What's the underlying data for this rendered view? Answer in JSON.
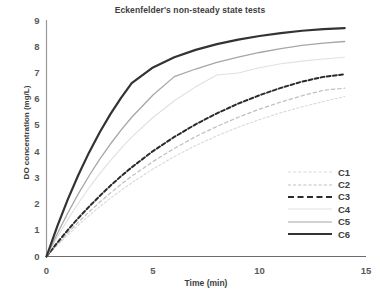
{
  "chart_data": {
    "type": "line",
    "title": "Eckenfelder's non-steady state tests",
    "xlabel": "Time (min)",
    "ylabel": "DO concentration (mg/L)",
    "xlim": [
      0,
      15
    ],
    "ylim": [
      0,
      9
    ],
    "xticks": [
      "0",
      "5",
      "10",
      "15"
    ],
    "yticks": [
      "0",
      "1",
      "2",
      "3",
      "4",
      "5",
      "6",
      "7",
      "8",
      "9"
    ],
    "grid": false,
    "legend_position": "inside-lower-right",
    "x": [
      0,
      0.5,
      1,
      1.5,
      2,
      2.5,
      3,
      3.5,
      4,
      5,
      6,
      7,
      8,
      9,
      10,
      11,
      12,
      13,
      14
    ],
    "series": [
      {
        "name": "C1",
        "style": "dotted",
        "color": "#d9d9d9",
        "width": 1.1,
        "values": [
          0,
          0.42,
          0.82,
          1.2,
          1.56,
          1.9,
          2.22,
          2.52,
          2.81,
          3.34,
          3.81,
          4.23,
          4.6,
          4.93,
          5.22,
          5.48,
          5.71,
          5.91,
          6.1
        ]
      },
      {
        "name": "C2",
        "style": "dashed",
        "color": "#bfbfbf",
        "width": 1.2,
        "values": [
          0,
          0.46,
          0.9,
          1.31,
          1.7,
          2.07,
          2.42,
          2.75,
          3.06,
          3.62,
          4.12,
          4.57,
          4.96,
          5.31,
          5.62,
          5.89,
          6.13,
          6.34,
          6.42
        ]
      },
      {
        "name": "C3",
        "style": "bold-dashed",
        "color": "#2b2b2b",
        "width": 2.0,
        "values": [
          0,
          0.52,
          1.01,
          1.47,
          1.9,
          2.31,
          2.7,
          3.06,
          3.4,
          4.02,
          4.56,
          5.04,
          5.46,
          5.83,
          6.15,
          6.43,
          6.67,
          6.85,
          6.95
        ]
      },
      {
        "name": "C4",
        "style": "solid",
        "color": "#e0e0e0",
        "width": 1.1,
        "values": [
          0,
          0.73,
          1.41,
          2.04,
          2.62,
          3.16,
          3.66,
          4.12,
          4.55,
          5.3,
          5.94,
          6.47,
          6.92,
          7.0,
          7.2,
          7.35,
          7.45,
          7.53,
          7.6
        ]
      },
      {
        "name": "C5",
        "style": "solid",
        "color": "#a6a6a6",
        "width": 1.3,
        "values": [
          0,
          0.86,
          1.66,
          2.4,
          3.08,
          3.71,
          4.29,
          4.82,
          5.31,
          6.16,
          6.86,
          7.15,
          7.4,
          7.6,
          7.78,
          7.93,
          8.05,
          8.14,
          8.2
        ]
      },
      {
        "name": "C6",
        "style": "solid",
        "color": "#333333",
        "width": 2.2,
        "values": [
          0,
          1.14,
          2.18,
          3.12,
          3.97,
          4.74,
          5.43,
          6.05,
          6.61,
          7.21,
          7.6,
          7.88,
          8.1,
          8.27,
          8.41,
          8.52,
          8.61,
          8.67,
          8.71
        ]
      }
    ]
  },
  "legend": {
    "items": [
      {
        "label": "C1"
      },
      {
        "label": "C2"
      },
      {
        "label": "C3"
      },
      {
        "label": "C4"
      },
      {
        "label": "C5"
      },
      {
        "label": "C6"
      }
    ]
  }
}
